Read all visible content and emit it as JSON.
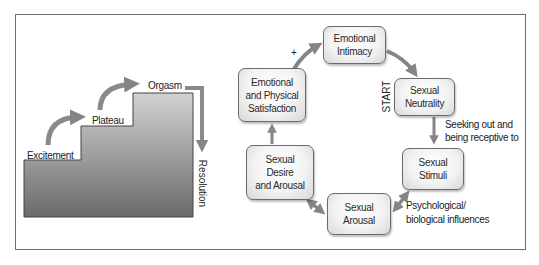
{
  "figure": {
    "left_panel": {
      "title": "Linear model of sexual response",
      "stages": [
        {
          "label": "Excitement"
        },
        {
          "label": "Plateau"
        },
        {
          "label": "Orgasm"
        },
        {
          "label": "Resolution"
        }
      ],
      "colors": {
        "step_top": "#c8c8c8",
        "step_bottom": "#6b6b6b",
        "arrow": "#8a8a8a"
      }
    },
    "right_panel": {
      "title": "Circular model of sexual response",
      "start_label": "START",
      "plus_label": "+",
      "nodes": [
        {
          "id": "emotional-intimacy",
          "label": "Emotional\nIntimacy"
        },
        {
          "id": "sexual-neutrality",
          "label": "Sexual\nNeutrality"
        },
        {
          "id": "sexual-stimuli",
          "label": "Sexual\nStimuli"
        },
        {
          "id": "sexual-arousal",
          "label": "Sexual\nArousal"
        },
        {
          "id": "sexual-desire-arousal",
          "label": "Sexual\nDesire\nand Arousal"
        },
        {
          "id": "emotional-physical-satisfaction",
          "label": "Emotional\nand Physical\nSatisfaction"
        }
      ],
      "edge_labels": {
        "neutrality_to_stimuli_line1": "Seeking out and",
        "neutrality_to_stimuli_line2": "being receptive to",
        "stimuli_arousal_line1": "Psychological/",
        "stimuli_arousal_line2": "biological influences"
      },
      "colors": {
        "arrow": "#858585",
        "box_border": "#6a6a6a"
      }
    }
  }
}
